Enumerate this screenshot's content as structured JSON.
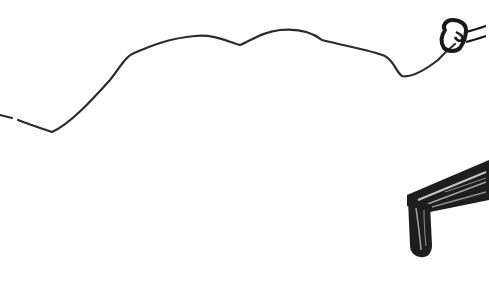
{
  "image": {
    "description": "Hand-drawn black ink sketch on white: a wavy line running across the top ending at a small hand-like shape, and a hatched plank with a dripping end at lower right",
    "background": "#ffffff",
    "ink_color": "#1a1a1a",
    "line_color": "#2b2b2b"
  },
  "elements": {
    "wavy_line": "wavy-line",
    "hand_shape": "hand",
    "plank": "plank",
    "drip": "drip"
  }
}
